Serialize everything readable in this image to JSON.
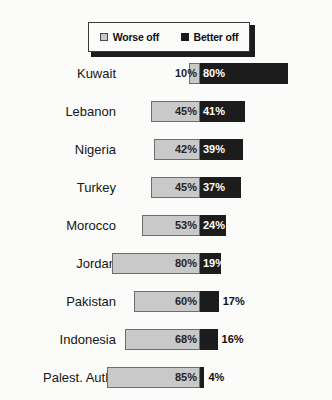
{
  "legend": {
    "items": [
      {
        "label": "Worse off",
        "swatch": "worse-off-swatch",
        "color": "#c9c9c9"
      },
      {
        "label": "Better off",
        "swatch": "better-off-swatch",
        "color": "#1c1c1c"
      }
    ]
  },
  "chart_data": {
    "type": "bar",
    "subtype": "diverging-stacked-bar",
    "title": "",
    "subtitle": "",
    "xlabel": "",
    "ylabel": "",
    "grid": false,
    "legend_position": "top-center",
    "orientation": "horizontal",
    "value_suffix": "%",
    "center_at": 0,
    "categories": [
      "Kuwait",
      "Lebanon",
      "Nigeria",
      "Turkey",
      "Morocco",
      "Jordan",
      "Pakistan",
      "Indonesia",
      "Palest. Auth."
    ],
    "series": [
      {
        "name": "Worse off",
        "color": "#c9c9c9",
        "direction": "left",
        "values": [
          10,
          45,
          42,
          45,
          53,
          80,
          60,
          68,
          85
        ],
        "labels": [
          "10%",
          "45%",
          "42%",
          "45%",
          "53%",
          "80%",
          "60%",
          "68%",
          "85%"
        ]
      },
      {
        "name": "Better off",
        "color": "#1c1c1c",
        "direction": "right",
        "values": [
          80,
          41,
          39,
          37,
          24,
          19,
          17,
          16,
          4
        ],
        "labels": [
          "80%",
          "41%",
          "39%",
          "37%",
          "24%",
          "19%",
          "17%",
          "16%",
          "4%"
        ],
        "label_placement": [
          "inside",
          "inside",
          "inside",
          "inside",
          "inside",
          "inside",
          "outside",
          "outside",
          "outside"
        ]
      }
    ],
    "xlim": [
      -90,
      90
    ],
    "px_per_unit": 1.1,
    "center_px": 200
  }
}
